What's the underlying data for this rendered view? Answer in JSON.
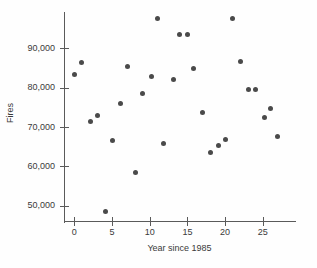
{
  "chart_data": {
    "type": "scatter",
    "title": "",
    "xlabel": "Year since 1985",
    "ylabel": "Fires",
    "xlim": [
      -1,
      29
    ],
    "ylim": [
      46000,
      99000
    ],
    "grid": false,
    "legend": null,
    "xticks": [
      0,
      5,
      10,
      15,
      20,
      25
    ],
    "xtick_labels": [
      "0",
      "5",
      "10",
      "15",
      "20",
      "25"
    ],
    "yticks": [
      50000,
      60000,
      70000,
      80000,
      90000
    ],
    "ytick_labels": [
      "50,000",
      "60,000",
      "70,000",
      "80,000",
      "90,000"
    ],
    "marker_color": "#4a4a4a",
    "axis_color": "#5a5a5a",
    "points": [
      {
        "x": 0,
        "y": 83300
      },
      {
        "x": 1,
        "y": 86400
      },
      {
        "x": 2.2,
        "y": 71500
      },
      {
        "x": 3.1,
        "y": 73000
      },
      {
        "x": 4.2,
        "y": 48400
      },
      {
        "x": 5.1,
        "y": 66500
      },
      {
        "x": 6.1,
        "y": 75900
      },
      {
        "x": 7.0,
        "y": 85500
      },
      {
        "x": 8.1,
        "y": 58500
      },
      {
        "x": 9.1,
        "y": 78400
      },
      {
        "x": 10.2,
        "y": 82900
      },
      {
        "x": 11.0,
        "y": 97600
      },
      {
        "x": 11.8,
        "y": 65800
      },
      {
        "x": 13.1,
        "y": 82000
      },
      {
        "x": 14.0,
        "y": 93500
      },
      {
        "x": 15.0,
        "y": 93400
      },
      {
        "x": 15.8,
        "y": 84800
      },
      {
        "x": 17.0,
        "y": 73700
      },
      {
        "x": 18.0,
        "y": 63600
      },
      {
        "x": 19.1,
        "y": 65300
      },
      {
        "x": 20.0,
        "y": 66900
      },
      {
        "x": 21.0,
        "y": 97500
      },
      {
        "x": 22.0,
        "y": 86600
      },
      {
        "x": 23.1,
        "y": 79500
      },
      {
        "x": 24.0,
        "y": 79500
      },
      {
        "x": 25.2,
        "y": 72300
      },
      {
        "x": 26.0,
        "y": 74700
      },
      {
        "x": 26.9,
        "y": 67700
      }
    ]
  }
}
